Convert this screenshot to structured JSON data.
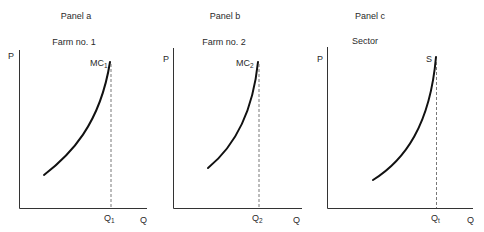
{
  "panels": [
    {
      "id": "a",
      "panel_label": "Panel a",
      "subtitle": "Farm no. 1",
      "y_axis_label": "P",
      "x_axis_label": "Q",
      "curve_label": "MC",
      "curve_label_sub": "1",
      "q_label": "Q",
      "q_label_sub": "1"
    },
    {
      "id": "b",
      "panel_label": "Panel b",
      "subtitle": "Farm no. 2",
      "y_axis_label": "P",
      "x_axis_label": "Q",
      "curve_label": "MC",
      "curve_label_sub": "2",
      "q_label": "Q",
      "q_label_sub": "2"
    },
    {
      "id": "c",
      "panel_label": "Panel c",
      "subtitle": "Sector",
      "y_axis_label": "P",
      "x_axis_label": "Q",
      "curve_label": "S",
      "curve_label_sub": "",
      "q_label": "Q",
      "q_label_sub": "t"
    }
  ]
}
